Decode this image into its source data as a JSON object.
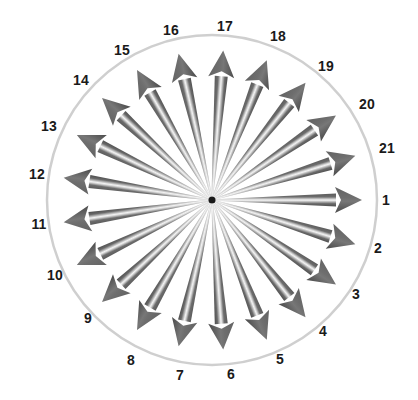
{
  "figure": {
    "name": "radial-arrow-dial",
    "background_color": "#ffffff"
  },
  "chart_data": {
    "type": "scatter",
    "title": "",
    "subtitle": "",
    "xlabel": "",
    "ylabel": "",
    "legend": [],
    "grid": false,
    "center": {
      "x": 212,
      "y": 200
    },
    "circle": {
      "radius": 165,
      "stroke_color": "#d4d4d4",
      "stroke_width": 2.5,
      "fill": "none"
    },
    "arrow_style": {
      "count": 21,
      "shaft_color_dark": "#555555",
      "shaft_color_mid": "#6e6e6e",
      "highlight_color": "#e8e8e8",
      "hub_color": "#1a1a1a",
      "tip_radius": 150,
      "tail_radius": 4,
      "head_length": 26,
      "head_half_width": 13,
      "shaft_half_width_at_tip": 6.5,
      "shaft_half_width_at_tail": 0.8
    },
    "angle_step_degrees": 17.142857142857142,
    "angle_reference": "label 1 at 0 degrees (east), increasing counterclockwise",
    "categories": [
      "1",
      "2",
      "3",
      "4",
      "5",
      "6",
      "7",
      "8",
      "9",
      "10",
      "11",
      "12",
      "13",
      "14",
      "15",
      "16",
      "17",
      "18",
      "19",
      "20",
      "21"
    ],
    "values": [
      1,
      1,
      1,
      1,
      1,
      1,
      1,
      1,
      1,
      1,
      1,
      1,
      1,
      1,
      1,
      1,
      1,
      1,
      1,
      1,
      1
    ],
    "points": [
      {
        "label": "1",
        "angle_deg": 0.0,
        "label_x": 386,
        "label_y": 200
      },
      {
        "label": "2",
        "angle_deg": 342.857,
        "label_x": 378,
        "label_y": 248
      },
      {
        "label": "3",
        "angle_deg": 325.714,
        "label_x": 356,
        "label_y": 294
      },
      {
        "label": "4",
        "angle_deg": 308.571,
        "label_x": 323,
        "label_y": 331
      },
      {
        "label": "5",
        "angle_deg": 291.428,
        "label_x": 280,
        "label_y": 359
      },
      {
        "label": "6",
        "angle_deg": 274.285,
        "label_x": 231,
        "label_y": 374
      },
      {
        "label": "7",
        "angle_deg": 257.142,
        "label_x": 180,
        "label_y": 375
      },
      {
        "label": "8",
        "angle_deg": 240.0,
        "label_x": 131,
        "label_y": 360
      },
      {
        "label": "9",
        "angle_deg": 222.857,
        "label_x": 88,
        "label_y": 318
      },
      {
        "label": "10",
        "angle_deg": 205.714,
        "label_x": 55,
        "label_y": 275
      },
      {
        "label": "11",
        "angle_deg": 188.571,
        "label_x": 39,
        "label_y": 224
      },
      {
        "label": "12",
        "angle_deg": 171.428,
        "label_x": 37,
        "label_y": 174
      },
      {
        "label": "13",
        "angle_deg": 154.285,
        "label_x": 49,
        "label_y": 126
      },
      {
        "label": "14",
        "angle_deg": 137.142,
        "label_x": 81,
        "label_y": 80
      },
      {
        "label": "15",
        "angle_deg": 120.0,
        "label_x": 122,
        "label_y": 50
      },
      {
        "label": "16",
        "angle_deg": 102.857,
        "label_x": 171,
        "label_y": 30
      },
      {
        "label": "17",
        "angle_deg": 85.714,
        "label_x": 225,
        "label_y": 26
      },
      {
        "label": "18",
        "angle_deg": 68.571,
        "label_x": 278,
        "label_y": 36
      },
      {
        "label": "19",
        "angle_deg": 51.428,
        "label_x": 326,
        "label_y": 66
      },
      {
        "label": "20",
        "angle_deg": 34.285,
        "label_x": 367,
        "label_y": 104
      },
      {
        "label": "21",
        "angle_deg": 17.142,
        "label_x": 387,
        "label_y": 148
      }
    ]
  }
}
